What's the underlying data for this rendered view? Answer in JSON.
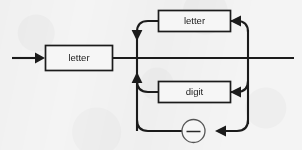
{
  "diagram": {
    "kind": "railroad-syntax-diagram",
    "background_color": "#f4f4f4",
    "line_color": "#1b1b1b",
    "box_fill": "#f6f6f6",
    "nodes": {
      "entry_box": {
        "label": "letter",
        "type": "nonterminal"
      },
      "loop_top_box": {
        "label": "letter",
        "type": "nonterminal"
      },
      "loop_mid_box": {
        "label": "digit",
        "type": "nonterminal"
      },
      "loop_bottom_terminal": {
        "label": "_",
        "type": "terminal"
      }
    },
    "arrows": [
      {
        "name": "entry-arrow",
        "direction": "right"
      },
      {
        "name": "top-rail-down-arrow",
        "direction": "down"
      },
      {
        "name": "letter-loop-arrow",
        "direction": "left"
      },
      {
        "name": "bottom-rail-up-arrow",
        "direction": "up"
      },
      {
        "name": "digit-loop-arrow",
        "direction": "left"
      },
      {
        "name": "underscore-loop-arrow",
        "direction": "left"
      }
    ]
  }
}
